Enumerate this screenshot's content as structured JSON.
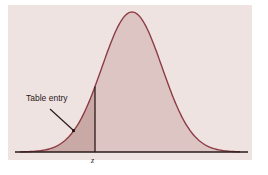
{
  "chart_data": {
    "type": "area",
    "title": "",
    "xlabel": "",
    "ylabel": "",
    "x_marker": {
      "label": "z",
      "position": -0.5
    },
    "annotation": {
      "text": "Table entry",
      "points_to": "shaded area left of z"
    },
    "grid": false,
    "legend": null,
    "colors": {
      "panel": "#efe3e1",
      "curve_fill": "#dcc5c3",
      "tail_fill": "#c9a9a6",
      "curve_stroke": "#8c3c44",
      "axis": "#2a1a1a"
    }
  },
  "labels": {
    "annotation": "Table entry",
    "z": "z"
  }
}
